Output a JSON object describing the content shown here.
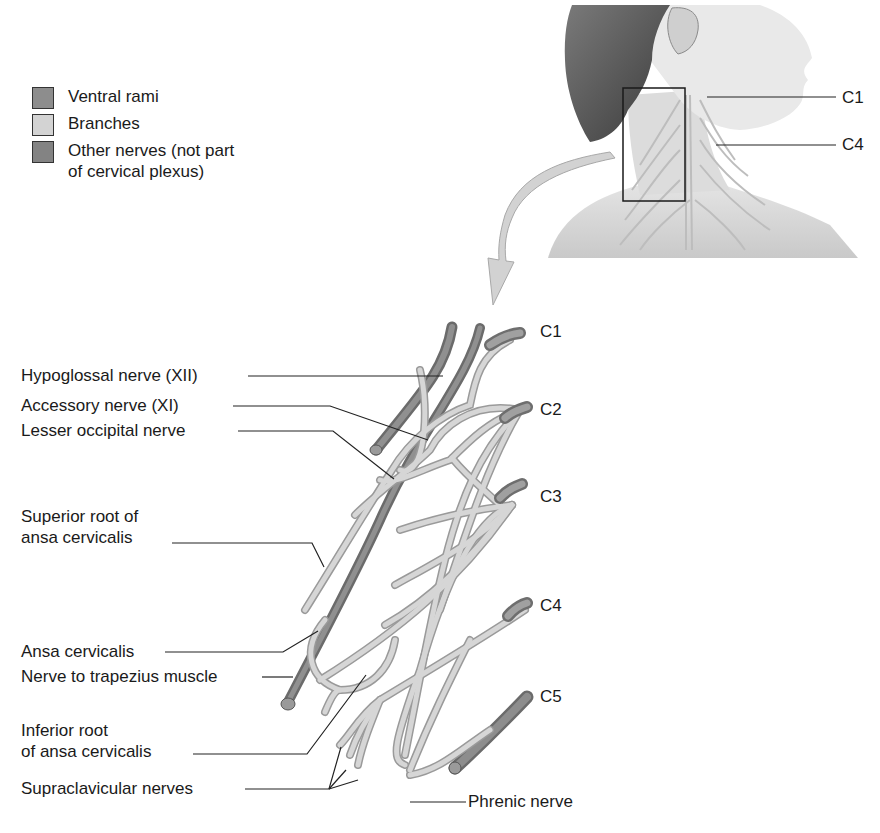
{
  "legend": {
    "items": [
      {
        "label": "Ventral rami",
        "color": "#8a8a8a"
      },
      {
        "label": "Branches",
        "color": "#d0d0d0"
      },
      {
        "label": "Other nerves (not part\nof cervical plexus)",
        "color": "#7a7a7a"
      }
    ]
  },
  "inset": {
    "labels": {
      "c1": "C1",
      "c4": "C4"
    }
  },
  "diagram": {
    "vertebral_labels": {
      "c1": "C1",
      "c2": "C2",
      "c3": "C3",
      "c4": "C4",
      "c5": "C5"
    },
    "nerve_labels": {
      "hypoglossal": "Hypoglossal nerve (XII)",
      "accessory": "Accessory nerve (XI)",
      "lesser_occipital": "Lesser occipital nerve",
      "superior_root": "Superior root of\nansa cervicalis",
      "ansa_cervicalis": "Ansa cervicalis",
      "nerve_trapezius": "Nerve to trapezius muscle",
      "inferior_root": "Inferior root\nof ansa cervicalis",
      "supraclavicular": "Supraclavicular nerves",
      "phrenic": "Phrenic nerve"
    }
  },
  "colors": {
    "ventral_rami": "#8a8a8a",
    "branches": "#d0d0d0",
    "other_nerves": "#6f6f6f",
    "branch_outline": "#9a9a9a",
    "leader_line": "#222222",
    "arrow": "#cfcfcf"
  }
}
